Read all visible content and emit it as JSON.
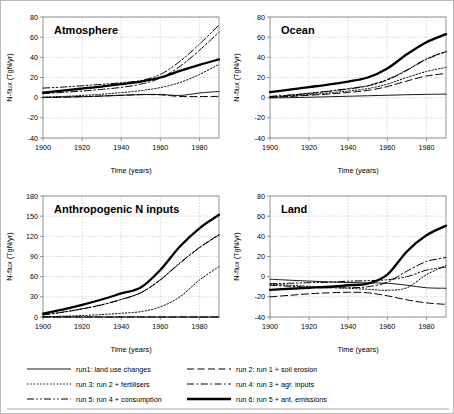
{
  "figure": {
    "background": "#ffffff",
    "border_color": "#b9b9b9",
    "grid_color": "#bdbdbd",
    "axis_color": "#7a7a7a",
    "line_color": "#000000"
  },
  "axes": {
    "xlabel": "Time (years)",
    "ylabel": "N-flux (TgN/yr)",
    "xticks": [
      1900,
      1920,
      1940,
      1960,
      1980
    ],
    "xlim": [
      1900,
      1990
    ],
    "yticks_flux": [
      80,
      60,
      40,
      20,
      0,
      -20,
      -40
    ],
    "ylim_flux": [
      -40,
      80
    ],
    "yticks_inputs": [
      180,
      150,
      120,
      90,
      60,
      30,
      0
    ],
    "ylim_inputs": [
      0,
      180
    ]
  },
  "legend": {
    "items": [
      {
        "key": "run1",
        "label": "run1: land use changes",
        "style": "solid-thin"
      },
      {
        "key": "run2",
        "label": "run 2: run 1 + soil erosion",
        "style": "dashed-long"
      },
      {
        "key": "run3",
        "label": "run 3: run 2 + fertilisers",
        "style": "dotted"
      },
      {
        "key": "run4",
        "label": "run 4: run 3 + agr. inputs",
        "style": "dashdot"
      },
      {
        "key": "run5",
        "label": "run 5: run 4 + consumption",
        "style": "dashdotdot"
      },
      {
        "key": "run6",
        "label": "run 6: run 5 + ant. emissions",
        "style": "solid-thick"
      }
    ]
  },
  "chart_data": [
    {
      "id": "atmosphere",
      "type": "line",
      "title": "Atmosphere",
      "xlabel": "Time (years)",
      "ylabel": "N-flux (TgN/yr)",
      "xlim": [
        1900,
        1990
      ],
      "ylim": [
        -40,
        80
      ],
      "xticks": [
        1900,
        1920,
        1940,
        1960,
        1980
      ],
      "yticks": [
        80,
        60,
        40,
        20,
        0,
        -20,
        -40
      ],
      "grid": true,
      "legend_position": "below-figure",
      "x": [
        1900,
        1910,
        1920,
        1930,
        1940,
        1950,
        1960,
        1970,
        1980,
        1990
      ],
      "series": [
        {
          "name": "run1: land use changes",
          "style": "solid-thin",
          "values": [
            0.3,
            0.6,
            1.0,
            1.6,
            2.3,
            3.0,
            3.2,
            2.2,
            4.6,
            6.2
          ]
        },
        {
          "name": "run 2: run 1 + soil erosion",
          "style": "dashed-long",
          "values": [
            0.2,
            0.5,
            1.0,
            1.6,
            2.4,
            3.0,
            2.8,
            1.2,
            1.1,
            1.3
          ]
        },
        {
          "name": "run 3: run 2 + fertilisers",
          "style": "dotted",
          "values": [
            0.4,
            1.2,
            2.2,
            3.4,
            5.0,
            7.0,
            10.0,
            15.0,
            23.0,
            33.0
          ]
        },
        {
          "name": "run 4: run 3 + agr. inputs",
          "style": "dashdot",
          "values": [
            4.0,
            5.2,
            6.6,
            8.2,
            10.2,
            13.4,
            19.5,
            31.0,
            47.0,
            65.0
          ]
        },
        {
          "name": "run 5: run 4 + consumption",
          "style": "dashdotdot",
          "values": [
            9.5,
            10.5,
            11.8,
            13.2,
            14.8,
            17.0,
            23.0,
            36.0,
            53.0,
            72.0
          ]
        },
        {
          "name": "run 6: run 5 + ant. emissions",
          "style": "solid-thick",
          "values": [
            5.0,
            7.0,
            9.0,
            11.0,
            13.5,
            16.0,
            20.0,
            26.5,
            32.5,
            38.0
          ]
        }
      ]
    },
    {
      "id": "ocean",
      "type": "line",
      "title": "Ocean",
      "xlabel": "Time (years)",
      "ylabel": "N-flux (TgN/yr)",
      "xlim": [
        1900,
        1990
      ],
      "ylim": [
        -40,
        80
      ],
      "xticks": [
        1900,
        1920,
        1940,
        1960,
        1980
      ],
      "yticks": [
        80,
        60,
        40,
        20,
        0,
        -20,
        -40
      ],
      "grid": true,
      "legend_position": "below-figure",
      "x": [
        1900,
        1910,
        1920,
        1930,
        1940,
        1950,
        1960,
        1970,
        1980,
        1990
      ],
      "series": [
        {
          "name": "run1: land use changes",
          "style": "solid-thin",
          "values": [
            -0.3,
            0.0,
            0.4,
            0.9,
            1.4,
            1.9,
            2.4,
            2.9,
            3.3,
            3.5
          ]
        },
        {
          "name": "run 2: run 1 + soil erosion",
          "style": "dashed-long",
          "values": [
            0.3,
            1.2,
            2.4,
            3.6,
            5.2,
            7.2,
            11.0,
            16.5,
            21.5,
            24.0
          ]
        },
        {
          "name": "run 3: run 2 + fertilisers",
          "style": "dotted",
          "values": [
            0.5,
            1.6,
            3.0,
            4.6,
            6.6,
            9.0,
            13.5,
            20.0,
            26.0,
            30.0
          ]
        },
        {
          "name": "run 4: run 3 + agr. inputs",
          "style": "dashdot",
          "values": [
            1.0,
            2.4,
            4.2,
            6.2,
            8.6,
            11.6,
            17.5,
            27.0,
            38.0,
            45.5
          ]
        },
        {
          "name": "run 5: run 4 + consumption",
          "style": "dashdotdot",
          "values": [
            1.2,
            2.6,
            4.4,
            6.5,
            9.0,
            12.0,
            18.0,
            27.5,
            38.5,
            46.0
          ]
        },
        {
          "name": "run 6: run 5 + ant. emissions",
          "style": "solid-thick",
          "values": [
            5.5,
            8.0,
            10.5,
            13.0,
            16.0,
            20.0,
            29.0,
            43.0,
            55.0,
            63.0
          ]
        }
      ]
    },
    {
      "id": "anthropogenic-n-inputs",
      "type": "line",
      "title": "Anthropogenic N inputs",
      "xlabel": "Time (years)",
      "ylabel": "N-flux (TgN/yr)",
      "xlim": [
        1900,
        1990
      ],
      "ylim": [
        0,
        180
      ],
      "xticks": [
        1900,
        1920,
        1940,
        1960,
        1980
      ],
      "yticks": [
        180,
        150,
        120,
        90,
        60,
        30,
        0
      ],
      "grid": true,
      "legend_position": "below-figure",
      "x": [
        1900,
        1910,
        1920,
        1930,
        1940,
        1950,
        1960,
        1970,
        1980,
        1990
      ],
      "series": [
        {
          "name": "run1: land use changes",
          "style": "solid-thin",
          "values": [
            0,
            0,
            0,
            0,
            0,
            0,
            0,
            0,
            0,
            0
          ]
        },
        {
          "name": "run 2: run 1 + soil erosion",
          "style": "dashed-long",
          "values": [
            0,
            0,
            0,
            0,
            0,
            0,
            0,
            0,
            0,
            0
          ]
        },
        {
          "name": "run 3: run 2 + fertilisers",
          "style": "dotted",
          "values": [
            0.5,
            1.2,
            2.2,
            3.6,
            5.5,
            8.0,
            15.0,
            30.0,
            55.0,
            75.0
          ]
        },
        {
          "name": "run 4: run 3 + agr. inputs",
          "style": "dashdot",
          "values": [
            3.0,
            7.0,
            12.0,
            18.0,
            26.0,
            36.0,
            55.0,
            80.0,
            103.0,
            122.0
          ]
        },
        {
          "name": "run 5: run 4 + consumption",
          "style": "dashdotdot",
          "values": [
            3.2,
            7.2,
            12.2,
            18.2,
            26.2,
            36.2,
            55.5,
            80.5,
            103.5,
            122.5
          ]
        },
        {
          "name": "run 6: run 5 + ant. emissions",
          "style": "solid-thick",
          "values": [
            5.0,
            11.0,
            18.0,
            26.0,
            35.0,
            44.0,
            70.0,
            105.0,
            132.0,
            152.0
          ]
        }
      ]
    },
    {
      "id": "land",
      "type": "line",
      "title": "Land",
      "xlabel": "Time (years)",
      "ylabel": "N-flux (TgN/yr)",
      "xlim": [
        1900,
        1990
      ],
      "ylim": [
        -40,
        80
      ],
      "xticks": [
        1900,
        1920,
        1940,
        1960,
        1980
      ],
      "yticks": [
        80,
        60,
        40,
        20,
        0,
        -20,
        -40
      ],
      "grid": true,
      "legend_position": "below-figure",
      "x": [
        1900,
        1910,
        1920,
        1930,
        1940,
        1950,
        1960,
        1970,
        1980,
        1990
      ],
      "series": [
        {
          "name": "run1: land use changes",
          "style": "solid-thin",
          "values": [
            -2.5,
            -3.5,
            -4.4,
            -5.2,
            -5.8,
            -6.2,
            -6.5,
            -8.5,
            -11.0,
            -11.5
          ]
        },
        {
          "name": "run 2: run 1 + soil erosion",
          "style": "dashed-long",
          "values": [
            -20.0,
            -18.5,
            -17.0,
            -16.0,
            -15.5,
            -16.0,
            -19.0,
            -23.0,
            -26.0,
            -27.5
          ]
        },
        {
          "name": "run 3: run 2 + fertilisers",
          "style": "dotted",
          "values": [
            -7.5,
            -8.5,
            -9.5,
            -10.5,
            -11.5,
            -12.5,
            -13.5,
            -11.0,
            2.0,
            11.0
          ]
        },
        {
          "name": "run 4: run 3 + agr. inputs",
          "style": "dashdot",
          "values": [
            -8.5,
            -9.5,
            -10.5,
            -11.0,
            -11.0,
            -10.0,
            -5.5,
            5.5,
            15.0,
            19.0
          ]
        },
        {
          "name": "run 5: run 4 + consumption",
          "style": "dashdotdot",
          "values": [
            -7.0,
            -6.5,
            -6.0,
            -5.5,
            -4.5,
            -4.0,
            -3.0,
            0.0,
            6.5,
            9.5
          ]
        },
        {
          "name": "run 6: run 5 + ant. emissions",
          "style": "solid-thick",
          "values": [
            -13.0,
            -12.0,
            -11.0,
            -10.0,
            -8.5,
            -7.0,
            2.0,
            25.0,
            41.0,
            50.5
          ]
        }
      ]
    }
  ]
}
